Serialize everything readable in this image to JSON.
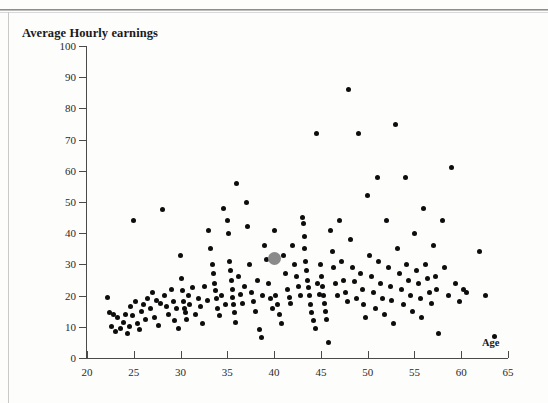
{
  "page": {
    "figure_title": "Average Hourly earnings",
    "x_axis_title": "Age"
  },
  "chart_data": {
    "type": "scatter",
    "title": "Average Hourly earnings",
    "xlabel": "Age",
    "ylabel": "Average Hourly earnings",
    "xlim": [
      20,
      65
    ],
    "ylim": [
      0,
      100
    ],
    "xticks": [
      20,
      25,
      30,
      35,
      40,
      45,
      50,
      55,
      60,
      65
    ],
    "yticks": [
      0,
      10,
      20,
      30,
      40,
      50,
      60,
      70,
      80,
      90,
      100
    ],
    "grid": false,
    "legend": null,
    "marker_color": "#0d0d0d",
    "highlight_color": "#8a8a8a",
    "highlight_point": {
      "x": 40,
      "y": 32,
      "label": "highlighted mean observation"
    },
    "points": [
      [
        22.2,
        19.5
      ],
      [
        22.4,
        14.5
      ],
      [
        22.6,
        10.2
      ],
      [
        22.8,
        14.0
      ],
      [
        23.0,
        8.5
      ],
      [
        23.3,
        13.0
      ],
      [
        23.6,
        9.5
      ],
      [
        23.9,
        11.5
      ],
      [
        24.1,
        13.8
      ],
      [
        24.3,
        8.0
      ],
      [
        24.5,
        10.0
      ],
      [
        24.7,
        16.5
      ],
      [
        24.9,
        13.5
      ],
      [
        25.0,
        44.0
      ],
      [
        25.2,
        18.0
      ],
      [
        25.4,
        11.0
      ],
      [
        25.6,
        9.0
      ],
      [
        25.8,
        15.0
      ],
      [
        26.0,
        17.0
      ],
      [
        26.2,
        12.5
      ],
      [
        26.5,
        19.0
      ],
      [
        26.8,
        16.0
      ],
      [
        27.0,
        21.0
      ],
      [
        27.2,
        13.0
      ],
      [
        27.4,
        18.5
      ],
      [
        27.6,
        10.5
      ],
      [
        27.9,
        17.5
      ],
      [
        28.1,
        47.5
      ],
      [
        28.3,
        20.0
      ],
      [
        28.5,
        16.5
      ],
      [
        28.7,
        14.0
      ],
      [
        29.0,
        22.0
      ],
      [
        29.2,
        18.0
      ],
      [
        29.4,
        12.0
      ],
      [
        29.6,
        16.0
      ],
      [
        29.8,
        9.5
      ],
      [
        30.0,
        33.0
      ],
      [
        30.1,
        25.5
      ],
      [
        30.2,
        21.5
      ],
      [
        30.3,
        18.0
      ],
      [
        30.4,
        16.0
      ],
      [
        30.5,
        14.5
      ],
      [
        30.6,
        12.5
      ],
      [
        30.8,
        20.0
      ],
      [
        31.0,
        17.0
      ],
      [
        31.3,
        22.5
      ],
      [
        31.6,
        14.0
      ],
      [
        31.9,
        19.0
      ],
      [
        32.1,
        16.5
      ],
      [
        32.3,
        11.0
      ],
      [
        32.6,
        23.0
      ],
      [
        32.9,
        18.5
      ],
      [
        33.0,
        41.0
      ],
      [
        33.2,
        35.0
      ],
      [
        33.4,
        30.0
      ],
      [
        33.5,
        27.0
      ],
      [
        33.6,
        24.0
      ],
      [
        33.7,
        21.5
      ],
      [
        33.8,
        19.0
      ],
      [
        34.0,
        16.0
      ],
      [
        34.2,
        13.5
      ],
      [
        34.4,
        20.0
      ],
      [
        34.6,
        48.0
      ],
      [
        34.8,
        17.0
      ],
      [
        35.0,
        44.0
      ],
      [
        35.1,
        40.0
      ],
      [
        35.2,
        31.0
      ],
      [
        35.3,
        28.0
      ],
      [
        35.4,
        25.0
      ],
      [
        35.5,
        22.0
      ],
      [
        35.6,
        19.5
      ],
      [
        35.7,
        17.0
      ],
      [
        35.8,
        14.5
      ],
      [
        35.9,
        11.5
      ],
      [
        36.0,
        56.0
      ],
      [
        36.2,
        26.0
      ],
      [
        36.4,
        20.5
      ],
      [
        36.6,
        17.5
      ],
      [
        36.8,
        23.0
      ],
      [
        37.0,
        50.0
      ],
      [
        37.2,
        42.0
      ],
      [
        37.4,
        30.0
      ],
      [
        37.6,
        21.0
      ],
      [
        37.8,
        18.0
      ],
      [
        38.0,
        15.0
      ],
      [
        38.2,
        25.0
      ],
      [
        38.4,
        9.0
      ],
      [
        38.6,
        6.5
      ],
      [
        38.8,
        20.0
      ],
      [
        39.0,
        36.0
      ],
      [
        39.2,
        31.5
      ],
      [
        39.4,
        24.0
      ],
      [
        39.6,
        19.0
      ],
      [
        39.8,
        16.0
      ],
      [
        40.0,
        41.0
      ],
      [
        40.2,
        20.0
      ],
      [
        40.4,
        17.0
      ],
      [
        40.6,
        14.0
      ],
      [
        40.8,
        11.0
      ],
      [
        41.0,
        33.0
      ],
      [
        41.2,
        27.0
      ],
      [
        41.4,
        22.0
      ],
      [
        41.6,
        19.5
      ],
      [
        41.8,
        17.5
      ],
      [
        42.0,
        36.0
      ],
      [
        42.2,
        30.0
      ],
      [
        42.4,
        26.0
      ],
      [
        42.6,
        23.0
      ],
      [
        42.8,
        20.0
      ],
      [
        43.0,
        45.0
      ],
      [
        43.1,
        43.0
      ],
      [
        43.2,
        39.0
      ],
      [
        43.3,
        35.0
      ],
      [
        43.4,
        31.0
      ],
      [
        43.5,
        28.0
      ],
      [
        43.6,
        25.0
      ],
      [
        43.7,
        22.5
      ],
      [
        43.8,
        20.0
      ],
      [
        43.9,
        17.0
      ],
      [
        44.0,
        14.5
      ],
      [
        44.2,
        12.0
      ],
      [
        44.4,
        9.5
      ],
      [
        44.5,
        72.0
      ],
      [
        44.6,
        24.0
      ],
      [
        44.8,
        20.5
      ],
      [
        45.0,
        30.0
      ],
      [
        45.1,
        26.0
      ],
      [
        45.2,
        23.0
      ],
      [
        45.3,
        20.0
      ],
      [
        45.4,
        17.5
      ],
      [
        45.5,
        15.0
      ],
      [
        45.6,
        12.5
      ],
      [
        45.8,
        5.0
      ],
      [
        46.0,
        41.0
      ],
      [
        46.2,
        34.0
      ],
      [
        46.4,
        29.0
      ],
      [
        46.6,
        24.0
      ],
      [
        46.8,
        20.0
      ],
      [
        47.0,
        44.0
      ],
      [
        47.2,
        31.0
      ],
      [
        47.4,
        25.0
      ],
      [
        47.6,
        21.0
      ],
      [
        47.8,
        18.0
      ],
      [
        48.0,
        86.0
      ],
      [
        48.2,
        38.0
      ],
      [
        48.4,
        29.0
      ],
      [
        48.6,
        24.5
      ],
      [
        48.8,
        19.0
      ],
      [
        49.0,
        72.0
      ],
      [
        49.2,
        27.0
      ],
      [
        49.4,
        22.0
      ],
      [
        49.6,
        17.0
      ],
      [
        49.8,
        13.0
      ],
      [
        50.0,
        52.0
      ],
      [
        50.2,
        33.0
      ],
      [
        50.4,
        26.0
      ],
      [
        50.6,
        21.0
      ],
      [
        50.8,
        16.0
      ],
      [
        51.0,
        58.0
      ],
      [
        51.2,
        31.0
      ],
      [
        51.4,
        24.0
      ],
      [
        51.6,
        19.0
      ],
      [
        51.8,
        14.0
      ],
      [
        52.0,
        44.0
      ],
      [
        52.2,
        29.0
      ],
      [
        52.4,
        23.0
      ],
      [
        52.6,
        18.5
      ],
      [
        52.8,
        11.0
      ],
      [
        53.0,
        75.0
      ],
      [
        53.2,
        35.0
      ],
      [
        53.4,
        27.0
      ],
      [
        53.6,
        22.0
      ],
      [
        53.8,
        17.0
      ],
      [
        54.0,
        58.0
      ],
      [
        54.2,
        30.0
      ],
      [
        54.4,
        25.0
      ],
      [
        54.6,
        20.0
      ],
      [
        54.8,
        15.0
      ],
      [
        55.0,
        40.0
      ],
      [
        55.2,
        28.0
      ],
      [
        55.4,
        24.0
      ],
      [
        55.6,
        19.0
      ],
      [
        55.8,
        13.0
      ],
      [
        56.0,
        48.0
      ],
      [
        56.2,
        30.0
      ],
      [
        56.4,
        25.5
      ],
      [
        56.6,
        21.0
      ],
      [
        56.8,
        17.5
      ],
      [
        57.0,
        36.0
      ],
      [
        57.2,
        26.0
      ],
      [
        57.4,
        22.0
      ],
      [
        57.6,
        8.0
      ],
      [
        58.0,
        44.0
      ],
      [
        58.2,
        29.0
      ],
      [
        58.6,
        20.0
      ],
      [
        59.0,
        61.0
      ],
      [
        59.4,
        24.0
      ],
      [
        59.8,
        18.0
      ],
      [
        60.2,
        22.0
      ],
      [
        60.6,
        21.0
      ],
      [
        62.0,
        34.0
      ],
      [
        62.6,
        20.0
      ],
      [
        63.6,
        7.0
      ]
    ]
  }
}
